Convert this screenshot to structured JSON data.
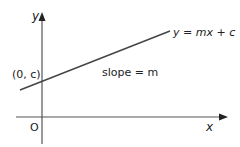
{
  "diagram": {
    "type": "linear-graph",
    "colors": {
      "axis": "#555555",
      "line": "#444444",
      "text": "#222222",
      "background": "#ffffff"
    },
    "axes": {
      "y_label": "y",
      "x_label": "x",
      "origin_label": "O"
    },
    "line": {
      "equation_label": "y = mx + c",
      "intercept_label": "(0, c)",
      "slope_label": "slope = m"
    }
  }
}
